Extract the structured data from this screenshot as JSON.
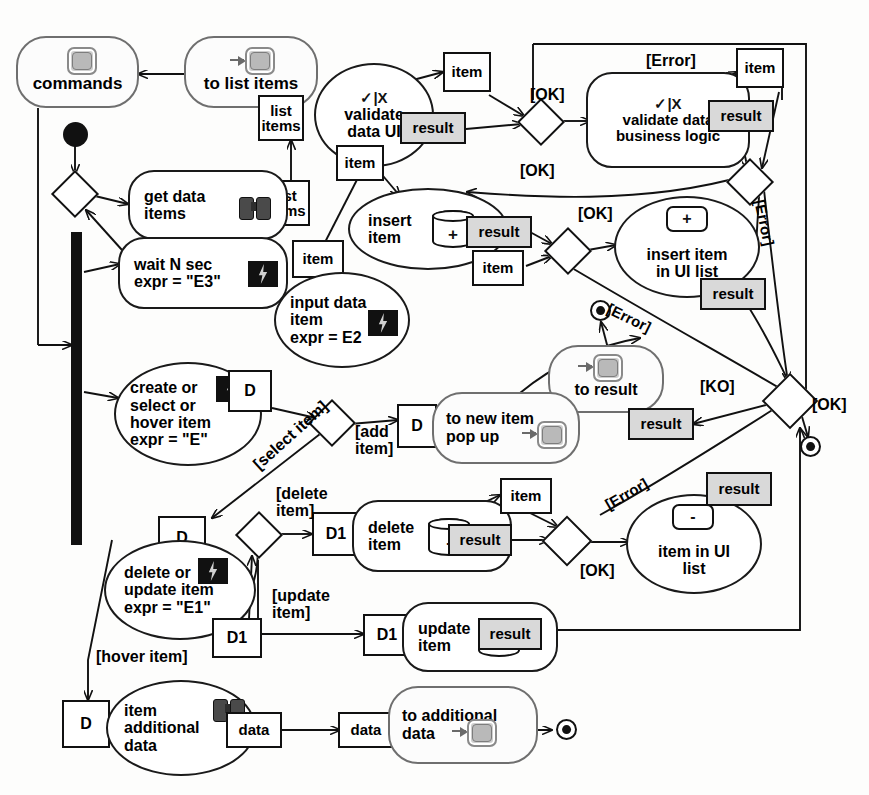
{
  "diagram": {
    "type": "uml-activity-diagram"
  },
  "activities": [
    {
      "id": "commands",
      "label": "commands",
      "glyph": "screen-icon"
    },
    {
      "id": "to-list-items",
      "label": "to list items",
      "glyph": "screen-in-icon"
    },
    {
      "id": "get-data-items",
      "label": "get data\nitems",
      "glyph": "binoculars-icon"
    },
    {
      "id": "wait-n-sec",
      "label": "wait N sec\nexpr = \"E3\"",
      "glyph": "bolt-icon"
    },
    {
      "id": "validate-data-ui",
      "label": "validate\ndata UI",
      "glyph": "check-x-icon"
    },
    {
      "id": "validate-bl",
      "label": "validate data\nbusiness logic",
      "glyph": "check-x-icon"
    },
    {
      "id": "insert-item",
      "label": "insert\nitem",
      "glyph": "cylinder-plus-icon"
    },
    {
      "id": "insert-item-ui",
      "label": "insert item\nin UI list",
      "glyph": "box-plus-icon"
    },
    {
      "id": "input-data-item",
      "label": "input data\nitem\nexpr = E2",
      "glyph": "bolt-icon"
    },
    {
      "id": "create-select",
      "label": "create or\nselect or\nhover item\nexpr = \"E\"",
      "glyph": "bolt-icon"
    },
    {
      "id": "to-new-item",
      "label": "to new item\npop up",
      "glyph": "screen-in-icon"
    },
    {
      "id": "to-result",
      "label": "to result",
      "glyph": "screen-in-icon"
    },
    {
      "id": "delete-update",
      "label": "delete or\nupdate item\nexpr = \"E1\"",
      "glyph": "bolt-icon"
    },
    {
      "id": "delete-item",
      "label": "delete\nitem",
      "glyph": "cylinder-minus-icon"
    },
    {
      "id": "update-item",
      "label": "update\nitem",
      "glyph": "cylinder-plusminus-icon"
    },
    {
      "id": "item-in-ui-list",
      "label": "item in UI\nlist",
      "glyph": "box-minus-icon"
    },
    {
      "id": "item-additional",
      "label": "item\nadditional\ndata",
      "glyph": "binoculars-icon"
    },
    {
      "id": "to-additional",
      "label": "to additional\ndata",
      "glyph": "screen-in-icon"
    }
  ],
  "labels": {
    "commands": "commands",
    "to_list_items": "to list items",
    "get_data_items_l1": "get data",
    "get_data_items_l2": "items",
    "wait_l1": "wait N sec",
    "wait_l2": "expr = \"E3\"",
    "validate_ui_l1": "validate",
    "validate_ui_l2": "data UI",
    "validate_bl_l1": "validate data",
    "validate_bl_l2": "business logic",
    "insert_item_l1": "insert",
    "insert_item_l2": "item",
    "insert_ui_l1": "insert item",
    "insert_ui_l2": "in UI list",
    "input_l1": "input data",
    "input_l2": "item",
    "input_l3": "expr = E2",
    "create_l1": "create or",
    "create_l2": "select or",
    "create_l3": "hover item",
    "create_l4": "expr = \"E\"",
    "to_new_item_l1": "to new item",
    "to_new_item_l2": "pop up",
    "to_result": "to result",
    "delete_update_l1": "delete or",
    "delete_update_l2": "update item",
    "delete_update_l3": "expr = \"E1\"",
    "delete_item_l1": "delete",
    "delete_item_l2": "item",
    "update_item_l1": "update",
    "update_item_l2": "item",
    "item_ui_list_l1": "item in UI",
    "item_ui_list_l2": "list",
    "item_add_l1": "item",
    "item_add_l2": "additional",
    "item_add_l3": "data",
    "to_additional_l1": "to additional",
    "to_additional_l2": "data",
    "check_x": "✓|X",
    "plus": "+",
    "minus": "-",
    "plus_minus": "±"
  },
  "pins": [
    {
      "id": "pin-list-items-top",
      "text": "list\nitems",
      "style": "plain"
    },
    {
      "id": "pin-list-items-mid",
      "text": "list\nitems",
      "style": "plain"
    },
    {
      "id": "pin-item-vui-out",
      "text": "item",
      "style": "plain"
    },
    {
      "id": "pin-result-vui",
      "text": "result",
      "style": "shaded"
    },
    {
      "id": "pin-item-vui-bottom",
      "text": "item",
      "style": "plain"
    },
    {
      "id": "pin-item-vbl-out",
      "text": "item",
      "style": "plain"
    },
    {
      "id": "pin-result-vbl",
      "text": "result",
      "style": "shaded"
    },
    {
      "id": "pin-result-insert",
      "text": "result",
      "style": "shaded"
    },
    {
      "id": "pin-item-insert-out",
      "text": "item",
      "style": "plain"
    },
    {
      "id": "pin-item-input",
      "text": "item",
      "style": "plain"
    },
    {
      "id": "pin-result-insert-ui",
      "text": "result",
      "style": "shaded"
    },
    {
      "id": "pin-result-to-result",
      "text": "result",
      "style": "shaded"
    },
    {
      "id": "pin-d-create",
      "text": "D",
      "style": "plain"
    },
    {
      "id": "pin-d-newitem",
      "text": "D",
      "style": "plain"
    },
    {
      "id": "pin-d-delupd",
      "text": "D",
      "style": "plain"
    },
    {
      "id": "pin-d1-delupd",
      "text": "D1",
      "style": "plain"
    },
    {
      "id": "pin-d1-delete",
      "text": "D1",
      "style": "plain"
    },
    {
      "id": "pin-d1-update",
      "text": "D1",
      "style": "plain"
    },
    {
      "id": "pin-item-delete-out",
      "text": "item",
      "style": "plain"
    },
    {
      "id": "pin-result-delete",
      "text": "result",
      "style": "shaded"
    },
    {
      "id": "pin-result-update",
      "text": "result",
      "style": "shaded"
    },
    {
      "id": "pin-result-itemui",
      "text": "result",
      "style": "shaded"
    },
    {
      "id": "pin-d-additional",
      "text": "D",
      "style": "plain"
    },
    {
      "id": "pin-data-out",
      "text": "data",
      "style": "plain"
    },
    {
      "id": "pin-data-in",
      "text": "data",
      "style": "plain"
    }
  ],
  "guards": [
    {
      "id": "guard-ok-1",
      "text": "[OK]"
    },
    {
      "id": "guard-ok-2",
      "text": "[OK]"
    },
    {
      "id": "guard-ok-3",
      "text": "[OK]"
    },
    {
      "id": "guard-ok-4",
      "text": "[OK]"
    },
    {
      "id": "guard-ok-5",
      "text": "[OK]"
    },
    {
      "id": "guard-error-top",
      "text": "[Error]"
    },
    {
      "id": "guard-error-right",
      "text": "[Error]"
    },
    {
      "id": "guard-error-mid",
      "text": "[Error]"
    },
    {
      "id": "guard-error-low",
      "text": "[Error]"
    },
    {
      "id": "guard-ko",
      "text": "[KO]"
    },
    {
      "id": "guard-add-item",
      "text": "[add\nitem]"
    },
    {
      "id": "guard-select-item",
      "text": "[select item]"
    },
    {
      "id": "guard-delete-item",
      "text": "[delete\nitem]"
    },
    {
      "id": "guard-update-item",
      "text": "[update\nitem]"
    },
    {
      "id": "guard-hover-item",
      "text": "[hover item]"
    }
  ],
  "guard_text": {
    "ok": "[OK]",
    "ko": "[KO]",
    "error": "[Error]",
    "add_item_l1": "[add",
    "add_item_l2": "item]",
    "select_item": "[select item]",
    "delete_item_l1": "[delete",
    "delete_item_l2": "item]",
    "update_item_l1": "[update",
    "update_item_l2": "item]",
    "hover_item": "[hover item]"
  },
  "pin_text": {
    "list": "list",
    "items": "items",
    "item": "item",
    "result": "result",
    "data": "data",
    "D": "D",
    "D1": "D1"
  },
  "colors": {
    "stroke": "#111111",
    "callout_stroke": "#6f6f6f",
    "pin_shaded": "#d9d9d9",
    "background": "#ffffff"
  },
  "control_nodes": [
    {
      "id": "initial-node",
      "kind": "initial"
    },
    {
      "id": "final-node-result",
      "kind": "final"
    },
    {
      "id": "final-node-ok",
      "kind": "final"
    },
    {
      "id": "final-node-data",
      "kind": "final"
    },
    {
      "id": "fork-bar",
      "kind": "fork-join-bar"
    },
    {
      "id": "decision-loop",
      "kind": "decision"
    },
    {
      "id": "decision-ui",
      "kind": "decision"
    },
    {
      "id": "decision-bl",
      "kind": "decision"
    },
    {
      "id": "decision-insert",
      "kind": "decision"
    },
    {
      "id": "decision-merge",
      "kind": "decision"
    },
    {
      "id": "decision-crud",
      "kind": "decision"
    },
    {
      "id": "decision-delupd",
      "kind": "decision"
    },
    {
      "id": "decision-delete",
      "kind": "decision"
    }
  ]
}
